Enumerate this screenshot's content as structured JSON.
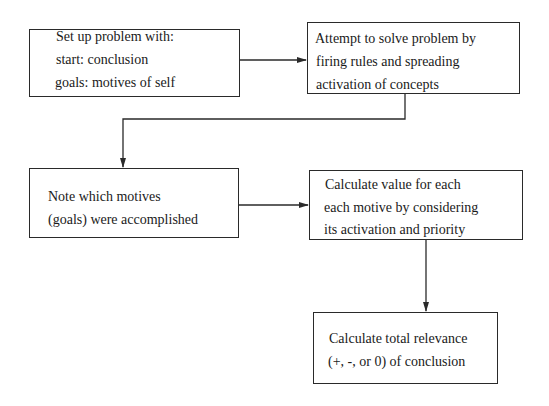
{
  "diagram": {
    "type": "flowchart",
    "nodes": [
      {
        "id": "setup",
        "lines": [
          "Set up problem with:",
          "start: conclusion",
          "goals: motives of self"
        ]
      },
      {
        "id": "solve",
        "lines": [
          "Attempt to solve problem by",
          "firing rules and spreading",
          "activation of concepts"
        ]
      },
      {
        "id": "note",
        "lines": [
          "Note which motives",
          "(goals) were accomplished"
        ]
      },
      {
        "id": "value",
        "lines": [
          "Calculate value for each",
          "each motive by considering",
          "its activation and priority"
        ]
      },
      {
        "id": "total",
        "lines": [
          "Calculate total relevance",
          "(+, -, or 0) of conclusion"
        ]
      }
    ],
    "edges": [
      {
        "from": "setup",
        "to": "solve"
      },
      {
        "from": "solve",
        "to": "note"
      },
      {
        "from": "note",
        "to": "value"
      },
      {
        "from": "value",
        "to": "total"
      }
    ]
  }
}
